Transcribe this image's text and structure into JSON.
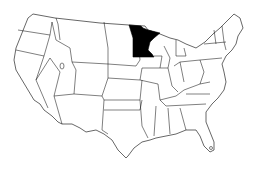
{
  "map": {
    "title": "",
    "region": "United States (contiguous)",
    "highlighted_state": "Minnesota",
    "colors": {
      "highlight": "#000000",
      "default": "#ffffff",
      "border": "#000000"
    }
  }
}
